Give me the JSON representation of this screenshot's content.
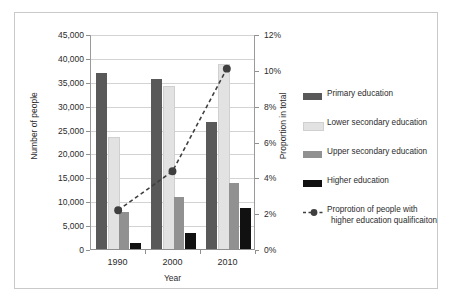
{
  "chart_data": {
    "type": "bar",
    "title": "",
    "xlabel": "Year",
    "ylabel": "Number of people",
    "y2label": "Proportion in total",
    "categories": [
      "1990",
      "2000",
      "2010"
    ],
    "ylim": [
      0,
      45000
    ],
    "y2lim": [
      0,
      12
    ],
    "yticks": [
      "0",
      "5,000",
      "10,000",
      "15,000",
      "20,000",
      "25,000",
      "30,000",
      "35,000",
      "40,000",
      "45,000"
    ],
    "ytick_values": [
      0,
      5000,
      10000,
      15000,
      20000,
      25000,
      30000,
      35000,
      40000,
      45000
    ],
    "y2ticks": [
      "0%",
      "2%",
      "4%",
      "6%",
      "8%",
      "10%",
      "12%"
    ],
    "y2tick_values": [
      0,
      2,
      4,
      6,
      8,
      10,
      12
    ],
    "grid": true,
    "legend_position": "right",
    "series": [
      {
        "name": "Primary education",
        "type": "bar",
        "color": "#595959",
        "axis": "left",
        "values": [
          37100,
          35700,
          26800
        ]
      },
      {
        "name": "Lower secondary education",
        "type": "bar",
        "color": "#e2e2e2",
        "axis": "left",
        "values": [
          23200,
          34000,
          38500
        ]
      },
      {
        "name": "Upper secondary education",
        "type": "bar",
        "color": "#919191",
        "axis": "left",
        "values": [
          8000,
          11200,
          14000
        ]
      },
      {
        "name": "Higher education",
        "type": "bar",
        "color": "#111111",
        "axis": "left",
        "values": [
          1500,
          3600,
          8800
        ]
      },
      {
        "name": "Proprotion of people with higher education qualificaiton",
        "type": "line",
        "color": "#3f3f3f",
        "axis": "right",
        "linestyle": "dashed",
        "marker": "circle",
        "values": [
          2.1,
          4.3,
          10.1
        ]
      }
    ]
  },
  "legend": {
    "items": [
      {
        "label": "Primary education",
        "swatch": "#595959",
        "kind": "swatch"
      },
      {
        "label": "Lower secondary education",
        "swatch": "#e2e2e2",
        "kind": "swatch"
      },
      {
        "label": "Upper secondary education",
        "swatch": "#919191",
        "kind": "swatch"
      },
      {
        "label": "Higher education",
        "swatch": "#111111",
        "kind": "swatch"
      },
      {
        "label": "Proprotion of people with",
        "label2": "higher education qualificaiton",
        "swatch": "#3f3f3f",
        "kind": "line-marker"
      }
    ]
  }
}
